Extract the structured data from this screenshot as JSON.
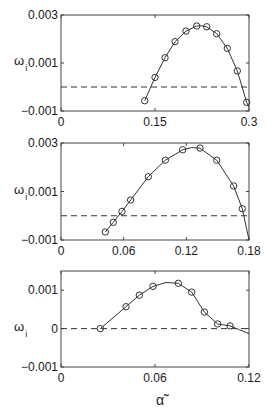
{
  "figure": {
    "xlabel": "α̃",
    "ylabel_main": "ω",
    "ylabel_sub": "i"
  },
  "chart_data": [
    {
      "type": "line",
      "title": "",
      "xlabel": "",
      "ylabel": "ω_i",
      "xlim": [
        0,
        0.3
      ],
      "ylim": [
        -0.001,
        0.003
      ],
      "xticks": [
        0,
        0.15,
        0.3
      ],
      "xtick_labels": [
        "0",
        "0.15",
        "0.3"
      ],
      "yticks": [
        -0.001,
        0.001,
        0.003
      ],
      "ytick_labels": [
        "-0.001",
        "0.001",
        "0.003"
      ],
      "grid": false,
      "reference_line": {
        "y": 0,
        "style": "dashed"
      },
      "series": [
        {
          "name": "theory",
          "style": "solid-line",
          "x": [
            0.1336,
            0.15,
            0.166,
            0.182,
            0.1995,
            0.2165,
            0.2245,
            0.2325,
            0.2484,
            0.2654,
            0.2814,
            0.2963,
            0.3
          ],
          "y": [
            -0.00057,
            0.0004,
            0.00122,
            0.00189,
            0.00233,
            0.00254,
            0.00255,
            0.00251,
            0.00222,
            0.00161,
            0.00067,
            -0.00064,
            -0.00085
          ]
        },
        {
          "name": "computed",
          "style": "open-circle",
          "x": [
            0.1336,
            0.15,
            0.166,
            0.182,
            0.1995,
            0.2165,
            0.2325,
            0.2484,
            0.2654,
            0.2814,
            0.2963
          ],
          "y": [
            -0.00057,
            0.0004,
            0.00122,
            0.00189,
            0.00233,
            0.00254,
            0.00251,
            0.00222,
            0.00161,
            0.00067,
            -0.00064
          ]
        }
      ]
    },
    {
      "type": "line",
      "title": "",
      "xlabel": "",
      "ylabel": "ω_i",
      "xlim": [
        0,
        0.18
      ],
      "ylim": [
        -0.001,
        0.003
      ],
      "xticks": [
        0,
        0.06,
        0.12,
        0.18
      ],
      "xtick_labels": [
        "0",
        "0.06",
        "0.12",
        "0.18"
      ],
      "yticks": [
        -0.001,
        0.001,
        0.003
      ],
      "ytick_labels": [
        "-0.001",
        "0.001",
        "0.003"
      ],
      "grid": false,
      "reference_line": {
        "y": 0,
        "style": "dashed"
      },
      "series": [
        {
          "name": "theory",
          "style": "solid-line",
          "x": [
            0.0424,
            0.0501,
            0.0584,
            0.0667,
            0.0836,
            0.0999,
            0.1165,
            0.125,
            0.1331,
            0.1491,
            0.1653,
            0.1736,
            0.18
          ],
          "y": [
            -0.00067,
            -0.00027,
            0.00018,
            0.00065,
            0.00161,
            0.00229,
            0.00272,
            0.00281,
            0.00279,
            0.00229,
            0.00123,
            0.00029,
            -0.001
          ]
        },
        {
          "name": "computed",
          "style": "open-circle",
          "x": [
            0.0424,
            0.0501,
            0.0584,
            0.0667,
            0.0836,
            0.0999,
            0.1165,
            0.1331,
            0.1491,
            0.1653,
            0.1736
          ],
          "y": [
            -0.00067,
            -0.00027,
            0.00018,
            0.00065,
            0.00161,
            0.00229,
            0.00272,
            0.00279,
            0.00229,
            0.00123,
            0.00029
          ]
        }
      ]
    },
    {
      "type": "line",
      "title": "",
      "xlabel": "α̃",
      "ylabel": "ω_i",
      "xlim": [
        0,
        0.12
      ],
      "ylim": [
        -0.001,
        0.0015
      ],
      "xticks": [
        0,
        0.06,
        0.12
      ],
      "xtick_labels": [
        "0",
        "0.06",
        "0.12"
      ],
      "yticks": [
        -0.001,
        0,
        0.001
      ],
      "ytick_labels": [
        "-0.001",
        "0",
        "0.001"
      ],
      "grid": false,
      "reference_line": {
        "y": 0,
        "style": "dashed"
      },
      "series": [
        {
          "name": "theory",
          "style": "solid-line",
          "x": [
            0.0251,
            0.0415,
            0.05,
            0.0587,
            0.067,
            0.0749,
            0.0834,
            0.0915,
            0.1,
            0.1079,
            0.114,
            0.12
          ],
          "y": [
            0.0,
            0.00057,
            0.00087,
            0.0011,
            0.0012,
            0.00118,
            0.00095,
            0.00043,
            0.00012,
            7e-05,
            -3e-05,
            -0.00013
          ]
        },
        {
          "name": "computed",
          "style": "open-circle",
          "x": [
            0.0251,
            0.0415,
            0.05,
            0.0587,
            0.0749,
            0.0834,
            0.0915,
            0.1,
            0.1079
          ],
          "y": [
            0.0,
            0.00057,
            0.00087,
            0.0011,
            0.00118,
            0.00095,
            0.00043,
            0.00012,
            7e-05
          ]
        }
      ]
    }
  ]
}
